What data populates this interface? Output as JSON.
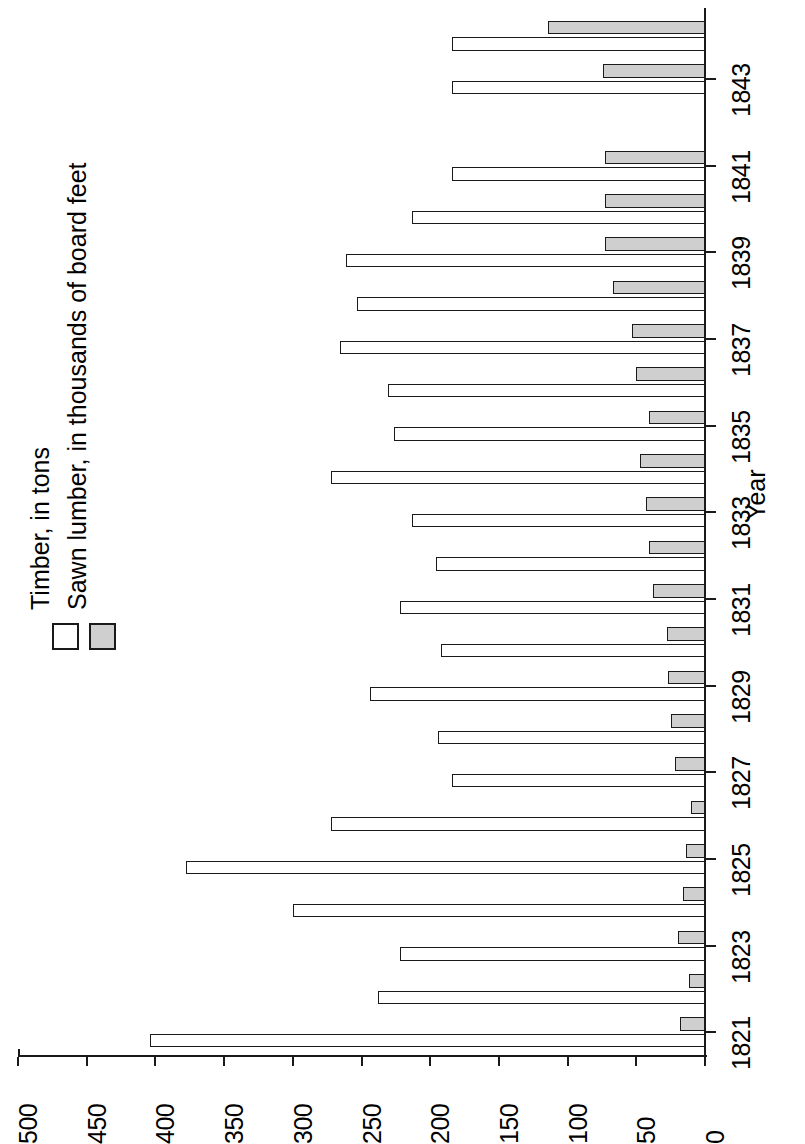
{
  "chart_data": {
    "type": "bar",
    "orientation": "rotated-horizontal",
    "title": "",
    "xlabel": "Year",
    "ylabel": "",
    "ylim": [
      0,
      500
    ],
    "yticks": [
      0,
      50,
      100,
      150,
      200,
      250,
      300,
      350,
      400,
      450,
      500
    ],
    "grid": false,
    "legend_position": "left",
    "categories": [
      "1821",
      "1822",
      "1823",
      "1824",
      "1825",
      "1826",
      "1827",
      "1828",
      "1829",
      "1830",
      "1831",
      "1832",
      "1833",
      "1834",
      "1835",
      "1836",
      "1837",
      "1838",
      "1839",
      "1840",
      "1841",
      "1842",
      "1843",
      "1844"
    ],
    "tick_labeled_categories": [
      "1821",
      "1823",
      "1825",
      "1827",
      "1829",
      "1831",
      "1833",
      "1835",
      "1837",
      "1839",
      "1841",
      "1843"
    ],
    "series": [
      {
        "name": "Timber, in tons",
        "color": "#ffffff",
        "values": [
          404,
          238,
          222,
          300,
          378,
          272,
          184,
          194,
          244,
          192,
          222,
          196,
          213,
          272,
          226,
          231,
          266,
          253,
          261,
          213,
          184,
          0,
          184,
          184
        ]
      },
      {
        "name": "Sawn lumber, in thousands of board feet",
        "color": "#cfcfcf",
        "values": [
          18,
          12,
          20,
          16,
          14,
          10,
          22,
          25,
          27,
          28,
          38,
          41,
          43,
          47,
          41,
          50,
          53,
          67,
          73,
          73,
          73,
          0,
          74,
          114
        ]
      }
    ]
  },
  "axes": {
    "value_axis_ticks": [
      "0",
      "50",
      "100",
      "150",
      "200",
      "250",
      "300",
      "350",
      "400",
      "450",
      "500"
    ],
    "category_axis_title": "Year"
  },
  "legend": {
    "items": [
      {
        "label": "Timber, in tons",
        "swatch": "white-square-swatch"
      },
      {
        "label": "Sawn lumber, in thousands of board feet",
        "swatch": "gray-square-swatch"
      }
    ]
  }
}
